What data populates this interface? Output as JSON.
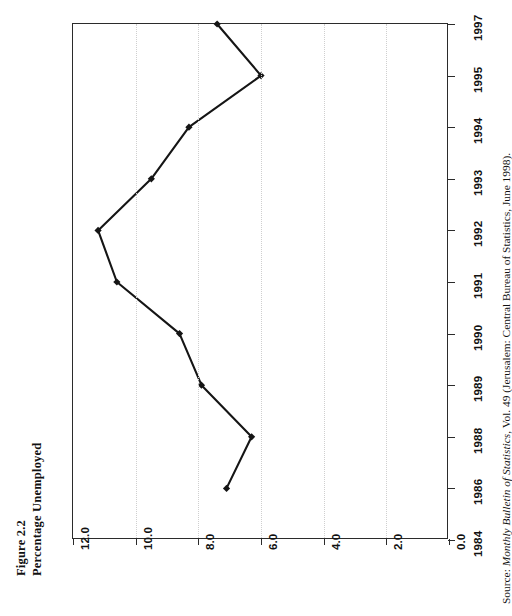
{
  "figure": {
    "label": "Figure 2.2",
    "title": "Percentage Unemployed"
  },
  "source": {
    "prefix": "Source:",
    "text": "Monthly Bulletin of Statistics",
    "suffix": ", Vol. 49 (Jerusalem: Central Bureau of Statistics, June 1998)."
  },
  "chart_data": {
    "type": "line",
    "title": "Percentage Unemployed",
    "orientation": "rotated-90-ccw",
    "xlabel": "",
    "ylabel": "",
    "categories": [
      "1984",
      "1986",
      "1988",
      "1989",
      "1990",
      "1991",
      "1992",
      "1993",
      "1994",
      "1995",
      "1997"
    ],
    "values": [
      null,
      7.1,
      6.3,
      7.9,
      8.6,
      10.6,
      11.2,
      9.5,
      8.3,
      6.0,
      7.4
    ],
    "value_ticks": [
      "12.0",
      "10.0",
      "8.0",
      "6.0",
      "4.0",
      "2.0",
      "0.0"
    ],
    "value_tick_numbers": [
      12.0,
      10.0,
      8.0,
      6.0,
      4.0,
      2.0,
      0.0
    ],
    "ylim": [
      0.0,
      12.0
    ],
    "grid": "value-axis dotted gridlines only",
    "legend": "none",
    "marker": "filled diamond",
    "line_color": "#151515"
  }
}
